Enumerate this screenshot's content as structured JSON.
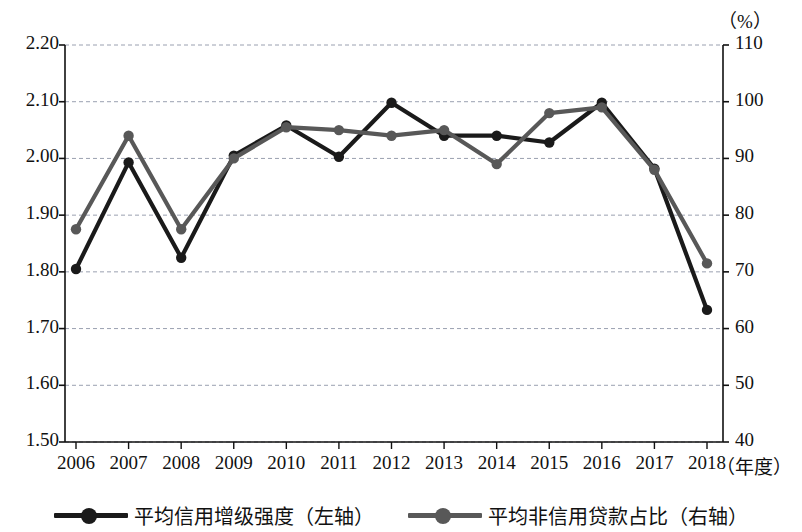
{
  "axes": {
    "left_unit": "",
    "right_unit": "（%）",
    "x_unit": "（年度）",
    "left_ticks": [
      "2.20",
      "2.10",
      "2.00",
      "1.90",
      "1.80",
      "1.70",
      "1.60",
      "1.50"
    ],
    "right_ticks": [
      "110",
      "100",
      "90",
      "80",
      "70",
      "60",
      "50",
      "40"
    ],
    "x_ticks": [
      "2006",
      "2007",
      "2008",
      "2009",
      "2010",
      "2011",
      "2012",
      "2013",
      "2014",
      "2015",
      "2016",
      "2017",
      "2018"
    ]
  },
  "legend": {
    "items": [
      {
        "label": "平均信用增级强度（左轴）",
        "color": "#1a1a1a",
        "marker": "line-with-circle-marker"
      },
      {
        "label": "平均非信用贷款占比（右轴）",
        "color": "#585858",
        "marker": "line-with-circle-marker"
      }
    ]
  },
  "chart_data": {
    "type": "line",
    "title": "",
    "xlabel": "（年度）",
    "ylabel": "",
    "y2label": "（%）",
    "grid": true,
    "legend_position": "bottom",
    "x": [
      "2006",
      "2007",
      "2008",
      "2009",
      "2010",
      "2011",
      "2012",
      "2013",
      "2014",
      "2015",
      "2016",
      "2017",
      "2018"
    ],
    "ylim": [
      1.5,
      2.2
    ],
    "y2lim": [
      40,
      110
    ],
    "yticks": [
      1.5,
      1.6,
      1.7,
      1.8,
      1.9,
      2.0,
      2.1,
      2.2
    ],
    "y2ticks": [
      40,
      50,
      60,
      70,
      80,
      90,
      100,
      110
    ],
    "series": [
      {
        "name": "平均信用增级强度（左轴）",
        "axis": "left",
        "color": "#1a1a1a",
        "values": [
          1.805,
          1.993,
          1.825,
          2.005,
          2.058,
          2.003,
          2.098,
          2.04,
          2.04,
          2.028,
          2.098,
          1.982,
          1.733
        ]
      },
      {
        "name": "平均非信用贷款占比（右轴）",
        "axis": "right",
        "color": "#585858",
        "values": [
          77.5,
          94.0,
          77.5,
          90.0,
          95.5,
          95.0,
          94.0,
          95.0,
          89.0,
          98.0,
          99.0,
          88.0,
          71.5
        ]
      }
    ]
  }
}
